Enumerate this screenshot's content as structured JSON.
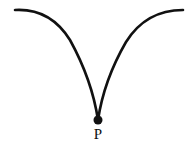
{
  "diagram": {
    "type": "cusp-curve",
    "stroke_color": "#111111",
    "background": "#ffffff",
    "point": {
      "label": "P",
      "x": 98,
      "y": 120
    },
    "left_arc_start": {
      "x": 15,
      "y": 10
    },
    "right_arc_end": {
      "x": 183,
      "y": 10
    }
  }
}
